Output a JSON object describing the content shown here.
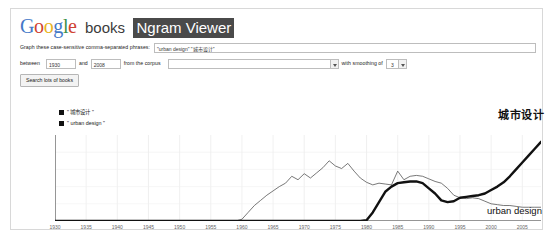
{
  "header": {
    "logo_g1": "G",
    "logo_o1": "o",
    "logo_o2": "o",
    "logo_g2": "g",
    "logo_l": "l",
    "logo_e": "e",
    "books_label": "books",
    "viewer_label": "Ngram Viewer"
  },
  "form": {
    "graph_these_label": "Graph these case-sensitive comma-separated phrases:",
    "phrases_value": "\"urban design\" \"城市设计\"",
    "phrases_placeholder": "",
    "between_label": "between",
    "start_year": "1930",
    "and_label": "and",
    "end_year": "2008",
    "corpus_label": "from the corpus",
    "corpus_value": "",
    "smoothing_label": "with smoothing of",
    "smoothing_value": "3",
    "search_button_label": "Search lots of books"
  },
  "legend": {
    "items": [
      {
        "label": "\" 城市设计 \"",
        "color": "#111111"
      },
      {
        "label": "\" urban design \"",
        "color": "#111111"
      }
    ]
  },
  "annotations": {
    "series_cn_label": "城市设计",
    "series_en_label": "urban design"
  },
  "chart_data": {
    "type": "line",
    "title": "",
    "xlabel": "",
    "ylabel": "",
    "grid": true,
    "legend_position": "top-left",
    "xlim": [
      1930,
      2008
    ],
    "ylim": [
      0,
      100
    ],
    "ticks": [
      "1930",
      "1935",
      "1940",
      "1945",
      "1950",
      "1955",
      "1960",
      "1965",
      "1970",
      "1975",
      "1980",
      "1985",
      "1990",
      "1995",
      "2000",
      "2005"
    ],
    "x": [
      1930,
      1932,
      1934,
      1936,
      1938,
      1940,
      1942,
      1944,
      1946,
      1948,
      1950,
      1952,
      1954,
      1956,
      1958,
      1959,
      1960,
      1961,
      1962,
      1963,
      1964,
      1965,
      1966,
      1967,
      1968,
      1969,
      1970,
      1971,
      1972,
      1973,
      1974,
      1975,
      1976,
      1977,
      1978,
      1979,
      1980,
      1981,
      1982,
      1983,
      1984,
      1985,
      1986,
      1987,
      1988,
      1989,
      1990,
      1991,
      1992,
      1993,
      1994,
      1995,
      1996,
      1997,
      1998,
      1999,
      2000,
      2001,
      2002,
      2003,
      2004,
      2005,
      2006,
      2007,
      2008
    ],
    "series": [
      {
        "name": "\"urban design\"",
        "style": "thin",
        "color": "#555555",
        "values": [
          0,
          0,
          0,
          0,
          0,
          0,
          0,
          0,
          0,
          0,
          0,
          0,
          0,
          0,
          0,
          0,
          2,
          10,
          18,
          24,
          30,
          35,
          40,
          44,
          52,
          48,
          55,
          50,
          56,
          62,
          70,
          64,
          61,
          67,
          58,
          50,
          45,
          42,
          44,
          43,
          42,
          58,
          48,
          52,
          53,
          52,
          49,
          46,
          44,
          38,
          30,
          27,
          26,
          27,
          26,
          23,
          20,
          19,
          18,
          18,
          17,
          16,
          16,
          16,
          16
        ]
      },
      {
        "name": "\"城市设计\"",
        "style": "thick",
        "color": "#111111",
        "values": [
          0,
          0,
          0,
          0,
          0,
          0,
          0,
          0,
          0,
          0,
          0,
          0,
          0,
          0,
          0,
          0,
          0,
          0,
          0,
          0,
          0,
          0,
          0,
          0,
          0,
          0,
          0,
          0,
          0,
          0,
          0,
          0,
          0,
          0,
          0,
          0,
          1,
          10,
          22,
          34,
          40,
          44,
          45,
          46,
          46,
          44,
          38,
          32,
          24,
          22,
          23,
          27,
          28,
          29,
          30,
          32,
          36,
          40,
          45,
          52,
          60,
          68,
          76,
          84,
          92
        ]
      }
    ]
  }
}
